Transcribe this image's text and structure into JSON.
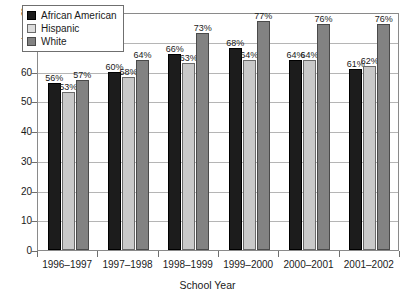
{
  "chart_data": {
    "type": "bar",
    "title": "",
    "xlabel": "School Year",
    "ylabel": "",
    "ylim": [
      0,
      80
    ],
    "yticks": [
      0,
      10,
      20,
      30,
      40,
      50,
      60,
      70,
      80
    ],
    "grid": true,
    "legend_position": "upper-left-inside",
    "categories": [
      "1996–1997",
      "1997–1998",
      "1998–1999",
      "1999–2000",
      "2000–2001",
      "2001–2002"
    ],
    "series": [
      {
        "name": "African American",
        "color": "#1c1c1c",
        "values": [
          56,
          60,
          66,
          68,
          64,
          61
        ],
        "labels": [
          "56%",
          "60%",
          "66%",
          "68%",
          "64%",
          "61%"
        ]
      },
      {
        "name": "Hispanic",
        "color": "#c9c9c9",
        "values": [
          53,
          58,
          63,
          64,
          64,
          62
        ],
        "labels": [
          "53%",
          "58%",
          "63%",
          "64%",
          "64%",
          "62%"
        ]
      },
      {
        "name": "White",
        "color": "#828282",
        "values": [
          57,
          64,
          73,
          77,
          76,
          76
        ],
        "labels": [
          "57%",
          "64%",
          "73%",
          "77%",
          "76%",
          "76%"
        ]
      }
    ]
  },
  "legend": {
    "entries": [
      {
        "label": "African American"
      },
      {
        "label": "Hispanic"
      },
      {
        "label": "White"
      }
    ]
  },
  "axes": {
    "x_title": "School Year"
  },
  "top_remnant": ""
}
